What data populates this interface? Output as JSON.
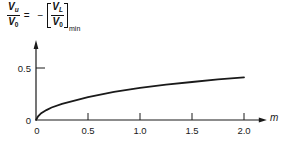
{
  "equation": {
    "lhs": {
      "num_var": "V",
      "num_sub": "u",
      "den_var": "V",
      "den_sub": "0"
    },
    "equals": "=",
    "minus": "−",
    "rhs": {
      "num_var": "V",
      "num_sub": "L",
      "den_var": "V",
      "den_sub": "0",
      "subscript": "min"
    }
  },
  "chart_data": {
    "type": "line",
    "xlabel": "m",
    "ylabel": "V_u/V_0",
    "x": [
      0,
      0.02,
      0.05,
      0.1,
      0.15,
      0.25,
      0.5,
      0.75,
      1.0,
      1.25,
      1.5,
      1.75,
      2.0
    ],
    "series": [
      {
        "name": "V_u/V_0",
        "values": [
          0,
          0.035,
          0.065,
          0.095,
          0.12,
          0.155,
          0.22,
          0.27,
          0.31,
          0.34,
          0.365,
          0.39,
          0.41
        ]
      }
    ],
    "xticks": [
      0.5,
      1.0,
      1.5,
      2.0
    ],
    "xtick_labels": [
      "0",
      "0.5",
      "1.0",
      "1.5",
      "2.0"
    ],
    "xtick_label_values": [
      0,
      0.5,
      1.0,
      1.5,
      2.0
    ],
    "yticks": [
      0.5
    ],
    "ytick_labels": [
      "0",
      "0.5"
    ],
    "ytick_label_values": [
      0,
      0.5
    ],
    "xlim": [
      0,
      2.21
    ],
    "ylim": [
      0,
      0.75
    ],
    "grid": false,
    "legend": null,
    "colors": {
      "line": "#1a1a1a",
      "axes": "#1a1a1a",
      "background": "#ffffff"
    }
  }
}
